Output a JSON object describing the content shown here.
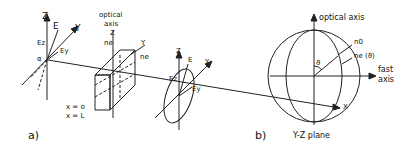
{
  "panel_a": {
    "label": "a)",
    "left_axes": {
      "z": "Z",
      "y": "Y",
      "E": "E",
      "Ez": "Ez",
      "Ey": "Ey",
      "alpha": "α"
    },
    "crystal": {
      "optical_axis_line1": "optical",
      "optical_axis_line2": "axis",
      "z": "Z",
      "y": "Y",
      "ne_top": "ne",
      "ne_side": "ne",
      "x0": "x = o",
      "xL": "x = L"
    },
    "right_axes": {
      "z": "Z",
      "y": "Y",
      "x": "X",
      "E": "E",
      "Ez": "Ez",
      "Ey": "Ey"
    }
  },
  "panel_b": {
    "label": "b)",
    "optical_axis": "optical axis",
    "n0": "n0",
    "ne_theta": "ne (ϑ)",
    "theta": "ϑ",
    "fast_axis_line1": "fast",
    "fast_axis_line2": "axis",
    "plane": "Y-Z plane"
  }
}
